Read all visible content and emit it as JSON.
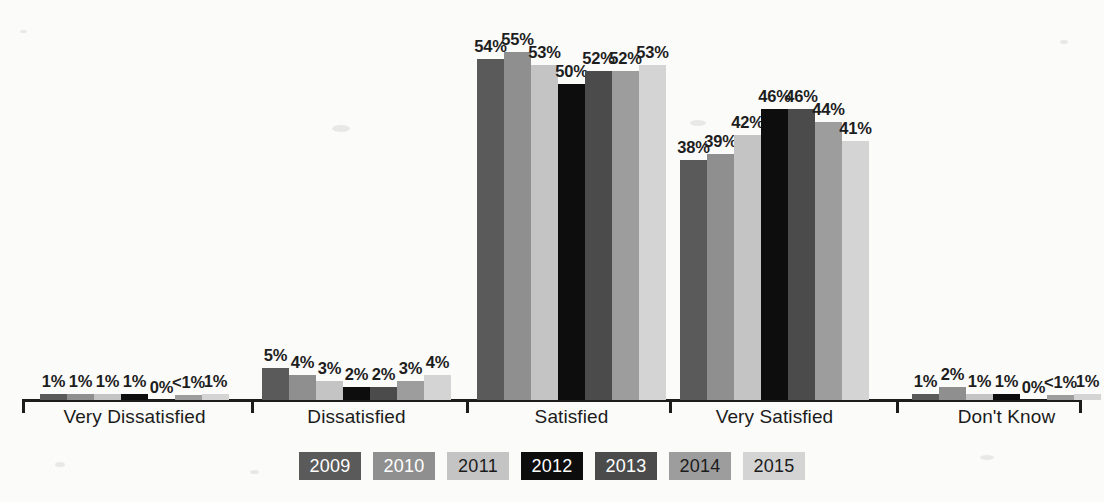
{
  "chart_data": {
    "type": "bar",
    "title": "",
    "subtitle": "",
    "xlabel": "",
    "ylabel": "",
    "ylim": [
      0,
      60
    ],
    "grid": false,
    "legend_position": "bottom",
    "categories": [
      "Very Dissatisfied",
      "Dissatisfied",
      "Satisfied",
      "Very Satisfied",
      "Don't Know"
    ],
    "series": [
      {
        "name": "2009",
        "color": "#5a5a5a",
        "text_color": "#ffffff",
        "values": [
          1,
          5,
          54,
          38,
          1
        ],
        "labels": [
          "1%",
          "5%",
          "54%",
          "38%",
          "1%"
        ]
      },
      {
        "name": "2010",
        "color": "#8f8f8f",
        "text_color": "#ffffff",
        "values": [
          1,
          4,
          55,
          39,
          2
        ],
        "labels": [
          "1%",
          "4%",
          "55%",
          "39%",
          "2%"
        ]
      },
      {
        "name": "2011",
        "color": "#c4c4c4",
        "text_color": "#1b1b1b",
        "values": [
          1,
          3,
          53,
          42,
          1
        ],
        "labels": [
          "1%",
          "3%",
          "53%",
          "42%",
          "1%"
        ]
      },
      {
        "name": "2012",
        "color": "#0d0d0d",
        "text_color": "#ffffff",
        "values": [
          1,
          2,
          50,
          46,
          1
        ],
        "labels": [
          "1%",
          "2%",
          "50%",
          "46%",
          "1%"
        ]
      },
      {
        "name": "2013",
        "color": "#4b4b4b",
        "text_color": "#ffffff",
        "values": [
          0,
          2,
          52,
          46,
          0
        ],
        "labels": [
          "0%",
          "2%",
          "52%",
          "46%",
          "0%"
        ]
      },
      {
        "name": "2014",
        "color": "#9d9d9d",
        "text_color": "#1b1b1b",
        "values": [
          0.5,
          3,
          52,
          44,
          0.5
        ],
        "labels": [
          "<1%",
          "3%",
          "52%",
          "44%",
          "<1%"
        ]
      },
      {
        "name": "2015",
        "color": "#d4d4d4",
        "text_color": "#1b1b1b",
        "values": [
          1,
          4,
          53,
          41,
          1
        ],
        "labels": [
          "1%",
          "4%",
          "53%",
          "41%",
          "1%"
        ]
      }
    ]
  },
  "legend": {
    "items": [
      {
        "label": "2009"
      },
      {
        "label": "2010"
      },
      {
        "label": "2011"
      },
      {
        "label": "2012"
      },
      {
        "label": "2013"
      },
      {
        "label": "2014"
      },
      {
        "label": "2015"
      }
    ]
  }
}
